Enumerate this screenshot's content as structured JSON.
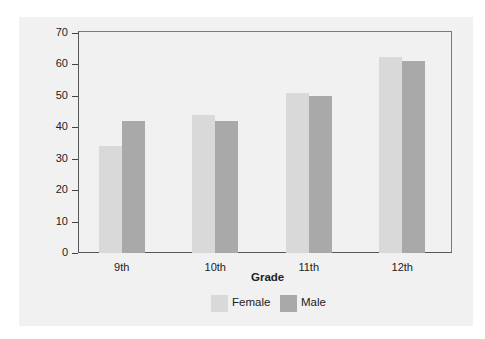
{
  "chart_data": {
    "type": "bar",
    "title": "",
    "xlabel": "Grade",
    "ylabel": "",
    "categories": [
      "9th",
      "10th",
      "11th",
      "12th"
    ],
    "series": [
      {
        "name": "Female",
        "values": [
          34,
          44,
          51,
          62.5
        ],
        "color": "#d9d9d9"
      },
      {
        "name": "Male",
        "values": [
          42,
          42,
          50,
          61
        ],
        "color": "#a9a9a9"
      }
    ],
    "ylim": [
      0,
      70
    ],
    "yticks": [
      0,
      10,
      20,
      30,
      40,
      50,
      60,
      70
    ],
    "grid": false,
    "legend_position": "bottom"
  },
  "labels": {
    "x_axis_title": "Grade",
    "legend": [
      "Female",
      "Male"
    ]
  }
}
